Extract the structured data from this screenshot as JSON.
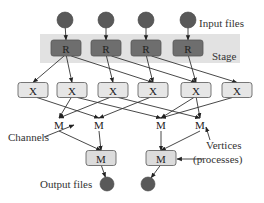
{
  "diagram": {
    "labels": {
      "input_files": "Input files",
      "stage": "Stage",
      "channels": "Channels",
      "vertices_line1": "Vertices",
      "vertices_line2": "(processes)",
      "output_files": "Output files"
    },
    "input_nodes": [
      "in1",
      "in2",
      "in3",
      "in4"
    ],
    "read_nodes": [
      {
        "id": "R1",
        "label": "R"
      },
      {
        "id": "R2",
        "label": "R"
      },
      {
        "id": "R3",
        "label": "R"
      },
      {
        "id": "R4",
        "label": "R"
      }
    ],
    "x_nodes": [
      {
        "id": "X1",
        "label": "X"
      },
      {
        "id": "X2",
        "label": "X"
      },
      {
        "id": "X3",
        "label": "X"
      },
      {
        "id": "X4",
        "label": "X"
      },
      {
        "id": "X5",
        "label": "X"
      },
      {
        "id": "X6",
        "label": "X"
      }
    ],
    "m_intermediate": [
      {
        "id": "Mi1",
        "label": "M"
      },
      {
        "id": "Mi2",
        "label": "M"
      },
      {
        "id": "Mi3",
        "label": "M"
      },
      {
        "id": "Mi4",
        "label": "M"
      }
    ],
    "m_nodes": [
      {
        "id": "M1",
        "label": "M"
      },
      {
        "id": "M2",
        "label": "M"
      }
    ],
    "output_nodes": [
      "out1",
      "out2"
    ],
    "edges": [
      [
        "in1",
        "R1"
      ],
      [
        "in2",
        "R2"
      ],
      [
        "in3",
        "R3"
      ],
      [
        "in4",
        "R4"
      ],
      [
        "R1",
        "X1"
      ],
      [
        "R1",
        "X2"
      ],
      [
        "R1",
        "X4"
      ],
      [
        "R2",
        "X3"
      ],
      [
        "R2",
        "X5"
      ],
      [
        "R3",
        "X4"
      ],
      [
        "R3",
        "X6"
      ],
      [
        "R4",
        "X5"
      ],
      [
        "X1",
        "Mi2"
      ],
      [
        "X2",
        "Mi1"
      ],
      [
        "X2",
        "Mi3"
      ],
      [
        "X3",
        "Mi1"
      ],
      [
        "X3",
        "Mi4"
      ],
      [
        "X4",
        "Mi2"
      ],
      [
        "X5",
        "Mi3"
      ],
      [
        "X5",
        "Mi4"
      ],
      [
        "X6",
        "Mi3"
      ],
      [
        "Mi1",
        "M1"
      ],
      [
        "Mi2",
        "M1"
      ],
      [
        "Mi3",
        "M2"
      ],
      [
        "Mi4",
        "M2"
      ],
      [
        "M1",
        "out1"
      ],
      [
        "M2",
        "out2"
      ]
    ],
    "colors": {
      "input_circle": "#595959",
      "r_box": "#6e6e6e",
      "stage_band": "#e2e2e2",
      "x_box": "#e6e6e6",
      "m_box": "#dcdcdc"
    }
  }
}
